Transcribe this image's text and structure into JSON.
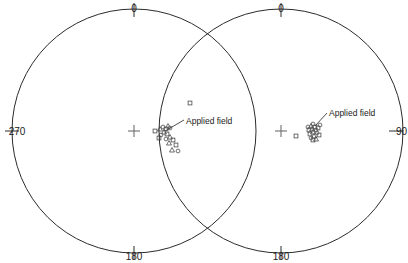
{
  "figure": {
    "type": "stereographic-pole-figure-pair",
    "background_color": "#ffffff",
    "line_color": "#2b2b2b",
    "marker_color": "#4a4a4a",
    "width": 408,
    "height": 263
  },
  "chart_data": {
    "type": "scatter",
    "title": "",
    "xlabel": "",
    "ylabel": "",
    "projection": "equal-area stereographic (pole figure)",
    "grid": false,
    "legend_position": "none",
    "panels": [
      {
        "name": "left-stereonet",
        "center": {
          "x": 134,
          "y": 131
        },
        "radius": 122,
        "azimuth_labels": [
          {
            "text": "0",
            "position": "top",
            "x": 134,
            "y": 12
          },
          {
            "text": "270",
            "position": "left",
            "x": 17,
            "y": 134
          },
          {
            "text": "180",
            "position": "bottom",
            "x": 134,
            "y": 257
          }
        ],
        "ticks": [
          {
            "angle_deg": 0,
            "label": "0"
          },
          {
            "angle_deg": 270,
            "label": "270"
          },
          {
            "angle_deg": 180,
            "label": "180"
          }
        ],
        "center_marker": "plus",
        "annotation": {
          "text": "Applied field",
          "text_x": 186,
          "text_y": 124,
          "leader_from_x": 184,
          "leader_from_y": 120,
          "leader_to_x": 165,
          "leader_to_y": 131
        },
        "points": [
          {
            "x": 190,
            "y": 103,
            "marker": "square"
          },
          {
            "x": 155,
            "y": 131,
            "marker": "square"
          },
          {
            "x": 160,
            "y": 129,
            "marker": "triangle"
          },
          {
            "x": 163,
            "y": 127,
            "marker": "circle"
          },
          {
            "x": 166,
            "y": 129,
            "marker": "square"
          },
          {
            "x": 168,
            "y": 126,
            "marker": "triangle"
          },
          {
            "x": 170,
            "y": 128,
            "marker": "circle"
          },
          {
            "x": 164,
            "y": 132,
            "marker": "triangle"
          },
          {
            "x": 167,
            "y": 134,
            "marker": "square"
          },
          {
            "x": 161,
            "y": 135,
            "marker": "circle"
          },
          {
            "x": 170,
            "y": 137,
            "marker": "triangle"
          },
          {
            "x": 173,
            "y": 140,
            "marker": "square"
          },
          {
            "x": 166,
            "y": 139,
            "marker": "circle"
          },
          {
            "x": 176,
            "y": 145,
            "marker": "square"
          },
          {
            "x": 172,
            "y": 150,
            "marker": "triangle"
          },
          {
            "x": 178,
            "y": 151,
            "marker": "circle"
          },
          {
            "x": 169,
            "y": 143,
            "marker": "triangle"
          },
          {
            "x": 159,
            "y": 138,
            "marker": "square"
          }
        ]
      },
      {
        "name": "right-stereonet",
        "center": {
          "x": 281,
          "y": 131
        },
        "radius": 122,
        "azimuth_labels": [
          {
            "text": "0",
            "position": "top",
            "x": 281,
            "y": 12
          },
          {
            "text": "90",
            "position": "right",
            "x": 396,
            "y": 134
          },
          {
            "text": "180",
            "position": "bottom",
            "x": 281,
            "y": 257
          }
        ],
        "ticks": [
          {
            "angle_deg": 0,
            "label": "0"
          },
          {
            "angle_deg": 90,
            "label": "90"
          },
          {
            "angle_deg": 180,
            "label": "180"
          }
        ],
        "center_marker": "plus",
        "annotation": {
          "text": "Applied field",
          "text_x": 329,
          "text_y": 116,
          "leader_from_x": 327,
          "leader_from_y": 113,
          "leader_to_x": 315,
          "leader_to_y": 126
        },
        "points": [
          {
            "x": 296,
            "y": 136,
            "marker": "square"
          },
          {
            "x": 311,
            "y": 126,
            "marker": "triangle"
          },
          {
            "x": 313,
            "y": 124,
            "marker": "circle"
          },
          {
            "x": 315,
            "y": 127,
            "marker": "square"
          },
          {
            "x": 312,
            "y": 129,
            "marker": "triangle"
          },
          {
            "x": 316,
            "y": 130,
            "marker": "circle"
          },
          {
            "x": 309,
            "y": 130,
            "marker": "square"
          },
          {
            "x": 313,
            "y": 132,
            "marker": "triangle"
          },
          {
            "x": 317,
            "y": 133,
            "marker": "circle"
          },
          {
            "x": 310,
            "y": 134,
            "marker": "square"
          },
          {
            "x": 314,
            "y": 136,
            "marker": "triangle"
          },
          {
            "x": 318,
            "y": 128,
            "marker": "square"
          },
          {
            "x": 320,
            "y": 125,
            "marker": "circle"
          },
          {
            "x": 311,
            "y": 138,
            "marker": "circle"
          },
          {
            "x": 316,
            "y": 139,
            "marker": "triangle"
          },
          {
            "x": 308,
            "y": 127,
            "marker": "circle"
          },
          {
            "x": 319,
            "y": 135,
            "marker": "square"
          },
          {
            "x": 313,
            "y": 140,
            "marker": "square"
          }
        ]
      }
    ]
  }
}
